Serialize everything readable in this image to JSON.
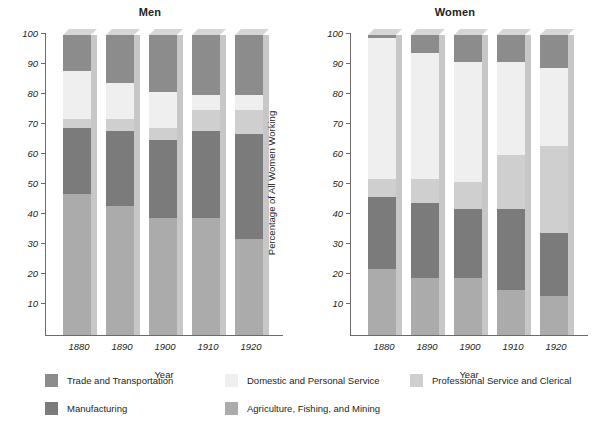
{
  "figure": {
    "width": 609,
    "height": 437,
    "background": "#ffffff"
  },
  "chart_data": {
    "type": "bar",
    "subtype": "stacked-100-percent",
    "title": "",
    "panels": [
      {
        "id": "men",
        "title": "Men",
        "xlabel": "Year",
        "ylabel": "Percentage of All Men Working",
        "categories": [
          "1880",
          "1890",
          "1900",
          "1910",
          "1920"
        ],
        "ylim": [
          0,
          100
        ],
        "yticks": [
          10,
          20,
          30,
          40,
          50,
          60,
          70,
          80,
          90,
          100
        ],
        "grid": false,
        "series": [
          {
            "name": "Agriculture, Fishing, and Mining",
            "values": [
              47,
              43,
              39,
              39,
              32
            ]
          },
          {
            "name": "Manufacturing",
            "values": [
              22,
              25,
              26,
              29,
              35
            ]
          },
          {
            "name": "Professional Service and Clerical",
            "values": [
              3,
              4,
              4,
              7,
              8
            ]
          },
          {
            "name": "Domestic and Personal Service",
            "values": [
              16,
              12,
              12,
              5,
              5
            ]
          },
          {
            "name": "Trade and Transportation",
            "values": [
              12,
              16,
              19,
              20,
              20
            ]
          }
        ],
        "stack_tops": {
          "1880": [
            47,
            69,
            72,
            88,
            100
          ],
          "1890": [
            43,
            68,
            72,
            84,
            100
          ],
          "1900": [
            39,
            65,
            69,
            81,
            100
          ],
          "1910": [
            39,
            68,
            75,
            80,
            100
          ],
          "1920": [
            32,
            67,
            75,
            80,
            100
          ]
        }
      },
      {
        "id": "women",
        "title": "Women",
        "xlabel": "Year",
        "ylabel": "Percentage of All Women Working",
        "categories": [
          "1880",
          "1890",
          "1900",
          "1910",
          "1920"
        ],
        "ylim": [
          0,
          100
        ],
        "yticks": [
          10,
          20,
          30,
          40,
          50,
          60,
          70,
          80,
          90,
          100
        ],
        "grid": false,
        "series": [
          {
            "name": "Agriculture, Fishing, and Mining",
            "values": [
              22,
              19,
              19,
              15,
              13
            ]
          },
          {
            "name": "Manufacturing",
            "values": [
              24,
              25,
              23,
              27,
              21
            ]
          },
          {
            "name": "Professional Service and Clerical",
            "values": [
              6,
              8,
              9,
              18,
              29
            ]
          },
          {
            "name": "Domestic and Personal Service",
            "values": [
              47,
              42,
              40,
              31,
              26
            ]
          },
          {
            "name": "Trade and Transportation",
            "values": [
              1,
              6,
              9,
              9,
              11
            ]
          }
        ],
        "stack_tops": {
          "1880": [
            22,
            46,
            52,
            99,
            100
          ],
          "1890": [
            19,
            44,
            52,
            94,
            100
          ],
          "1900": [
            19,
            42,
            51,
            91,
            100
          ],
          "1910": [
            15,
            42,
            60,
            91,
            100
          ],
          "1920": [
            13,
            34,
            63,
            89,
            100
          ]
        }
      }
    ],
    "legend": {
      "position": "bottom",
      "entries": [
        {
          "label": "Trade and Transportation",
          "color": "#8c8c8c"
        },
        {
          "label": "Domestic and Personal Service",
          "color": "#efefef"
        },
        {
          "label": "Professional Service and Clerical",
          "color": "#cfcfcf"
        },
        {
          "label": "Manufacturing",
          "color": "#7b7b7b"
        },
        {
          "label": "Agriculture, Fishing, and Mining",
          "color": "#ababab"
        }
      ]
    },
    "colors": {
      "trade_and_transportation": "#8c8c8c",
      "domestic_and_personal_service": "#efefef",
      "professional_service_and_clerical": "#cfcfcf",
      "manufacturing": "#7b7b7b",
      "agriculture_fishing_and_mining": "#ababab",
      "axis": "#6e6a68",
      "text": "#231f20"
    }
  }
}
